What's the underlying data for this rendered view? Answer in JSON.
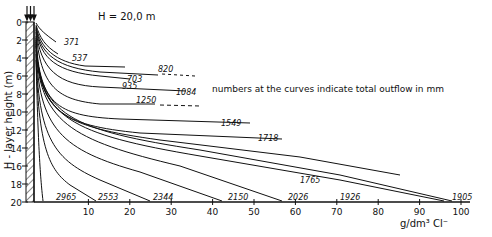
{
  "chart_data": {
    "type": "line",
    "title": "H = 20,0 m",
    "annotation": "numbers at the curves indicate total outflow in mm",
    "xlabel": "g/dm³ Cl⁻",
    "ylabel": "H - layer height (m)",
    "xlim": [
      0,
      100
    ],
    "ylim": [
      20,
      0
    ],
    "x_ticks": [
      "10",
      "20",
      "30",
      "40",
      "50",
      "60",
      "70",
      "80",
      "90",
      "100"
    ],
    "y_ticks": [
      "0",
      "2",
      "4",
      "6",
      "8",
      "10",
      "12",
      "14",
      "16",
      "18",
      "20"
    ],
    "series": [
      {
        "name": "371",
        "end_depth": 3.2,
        "end_conc": 8
      },
      {
        "name": "537",
        "end_depth": 5.4,
        "end_conc": 12
      },
      {
        "name": "703",
        "end_depth": 7.2,
        "end_conc": 37
      },
      {
        "name": "820",
        "end_depth": 8.2,
        "end_conc": 38
      },
      {
        "name": "935",
        "end_depth": 8.5,
        "end_conc": 34
      },
      {
        "name": "1084",
        "end_depth": 10.0,
        "end_conc": 46
      },
      {
        "name": "1250",
        "end_depth": 11.8,
        "end_conc": 30
      },
      {
        "name": "1549",
        "end_depth": 14.2,
        "end_conc": 55
      },
      {
        "name": "1718",
        "end_depth": 15.7,
        "end_conc": 63
      },
      {
        "name": "1765",
        "end_depth": 17.5,
        "end_conc": 85
      },
      {
        "name": "1905",
        "end_depth": 20.0,
        "end_conc": 100
      },
      {
        "name": "1926",
        "end_depth": 20.0,
        "end_conc": 97
      },
      {
        "name": "2026",
        "end_depth": 20.0,
        "end_conc": 57
      },
      {
        "name": "2150",
        "end_depth": 20.0,
        "end_conc": 43
      },
      {
        "name": "2344",
        "end_depth": 20.0,
        "end_conc": 25
      },
      {
        "name": "2553",
        "end_depth": 20.0,
        "end_conc": 12
      },
      {
        "name": "2965",
        "end_depth": 20.0,
        "end_conc": 1
      }
    ]
  }
}
